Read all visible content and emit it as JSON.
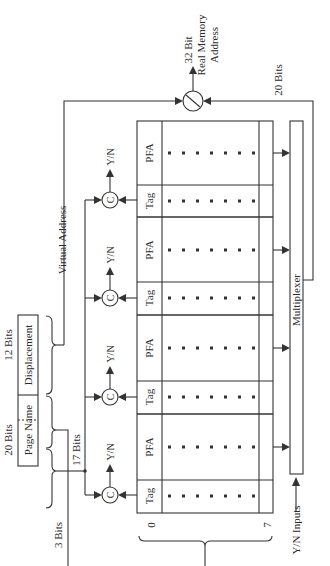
{
  "figure": {
    "orientation": "rotated-90-ccw",
    "colors": {
      "ink": "#333333",
      "background": "#ffffff"
    }
  },
  "virtual_address": {
    "title": "Virtual Address",
    "page_name_field": "Page Name",
    "displacement_field": "Displacement",
    "page_name_bits": "20 Bits",
    "displacement_bits": "12 Bits",
    "high_order_bits": "3 Bits",
    "low_order_bits": "17 Bits"
  },
  "tlb": {
    "row_labels": [
      "Tag",
      "PFA",
      "Tag",
      "PFA",
      "Tag",
      "PFA",
      "Tag",
      "PFA"
    ],
    "tag_label": "Tag",
    "pfa_label": "PFA",
    "index_start": "0",
    "index_end": "7",
    "comparator_label": "C",
    "compare_output": "Y/N",
    "compare_outputs": [
      "Y/N",
      "Y/N",
      "Y/N",
      "Y/N"
    ]
  },
  "multiplexer": {
    "label": "Multiplexer",
    "inputs_label": "Y/N Inputs",
    "output_bits": "20 Bits"
  },
  "output": {
    "line1": "32 Bit",
    "line2": "Real Memory",
    "line3": "Address"
  }
}
